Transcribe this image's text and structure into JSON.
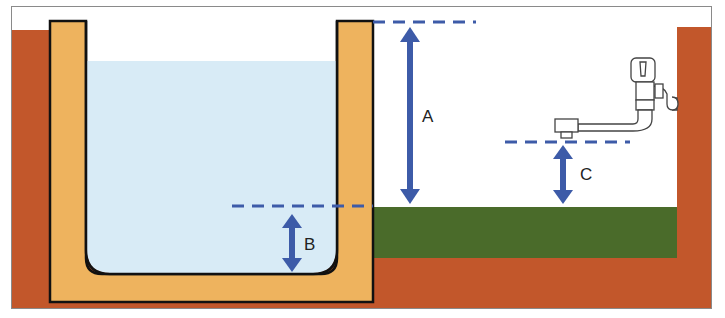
{
  "diagram": {
    "labels": {
      "a": "A",
      "b": "B",
      "c": "C"
    },
    "elements": {
      "pool": "Pool basin with water",
      "ground_soil": "Brick/soil ground",
      "grass": "Grass surface",
      "faucet": "Wall-mounted faucet",
      "wall": "Brick wall"
    },
    "colors": {
      "soil": "#c2572b",
      "pool_wall": "#eeb35e",
      "water": "#d8ebf6",
      "grass": "#4a6b2a",
      "arrow": "#3d5ba8",
      "outline": "#111111"
    },
    "measurements": [
      {
        "label": "A",
        "description": "Height from grass surface to top of pool wall"
      },
      {
        "label": "B",
        "description": "Depth from grass surface level to pool bottom"
      },
      {
        "label": "C",
        "description": "Height from grass surface to faucet outlet"
      }
    ]
  }
}
